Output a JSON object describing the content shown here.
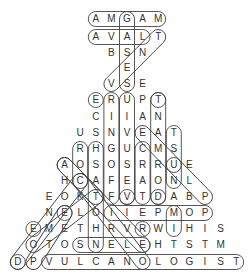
{
  "puzzle": {
    "type": "word-search",
    "shape": "volcano",
    "center_x": 127,
    "spacing": 15.6,
    "rows": [
      {
        "y": 19,
        "start": -2,
        "letters": "AMGAM"
      },
      {
        "y": 37,
        "start": -2,
        "letters": "AVALT"
      },
      {
        "y": 53,
        "start": -1,
        "letters": "BSN"
      },
      {
        "y": 68,
        "start": 0,
        "letters": "E"
      },
      {
        "y": 84,
        "start": -1,
        "letters": "VSE"
      },
      {
        "y": 100,
        "start": -2,
        "letters": "ERUPT"
      },
      {
        "y": 117,
        "start": -2,
        "letters": "CIIAN"
      },
      {
        "y": 133,
        "start": -3,
        "letters": "USNVEAT"
      },
      {
        "y": 149,
        "start": -3,
        "letters": "RHGUCMS"
      },
      {
        "y": 165,
        "start": -4,
        "letters": "AOSOSRRUE"
      },
      {
        "y": 181,
        "start": -4,
        "letters": "HCAFEAONL"
      },
      {
        "y": 197,
        "start": -5,
        "letters": "EOKTFVTDABP"
      },
      {
        "y": 213,
        "start": -5,
        "letters": "NELOIIEPMOP"
      },
      {
        "y": 229,
        "start": -6,
        "letters": "EMETHRVRWIHIS"
      },
      {
        "y": 245,
        "start": -6,
        "letters": "OTOSNELEHTSTM"
      },
      {
        "y": 262,
        "start": -7,
        "letters": "DPVULCANOLOGIST"
      }
    ],
    "found_words": [
      {
        "word": "MAGMA",
        "from": [
          0,
          -2
        ],
        "to": [
          0,
          2
        ]
      },
      {
        "word": "LAVA",
        "from": [
          1,
          -2
        ],
        "to": [
          1,
          1
        ]
      },
      {
        "word": "GASES",
        "from": [
          0,
          0
        ],
        "to": [
          4,
          0
        ]
      },
      {
        "word": "VENT",
        "from": [
          1,
          2
        ],
        "to": [
          4,
          -1
        ]
      },
      {
        "word": "ERUPT",
        "from": [
          5,
          -2
        ],
        "to": [
          5,
          -2
        ]
      },
      {
        "word": "RING OF F",
        "from": [
          5,
          -1
        ],
        "to": [
          11,
          -1
        ]
      },
      {
        "word": "VESUVIU",
        "from": [
          5,
          0
        ],
        "to": [
          11,
          0
        ]
      },
      {
        "word": "DORMANT",
        "from": [
          5,
          2
        ],
        "to": [
          11,
          2
        ]
      },
      {
        "word": "T",
        "from": [
          5,
          2
        ],
        "to": [
          5,
          2
        ]
      },
      {
        "word": "CRAT",
        "from": [
          8,
          1
        ],
        "to": [
          11,
          1
        ]
      },
      {
        "word": "TSUN",
        "from": [
          7,
          3
        ],
        "to": [
          10,
          3
        ]
      },
      {
        "word": "EMS",
        "from": [
          7,
          1
        ],
        "to": [
          9,
          3
        ]
      },
      {
        "word": "R",
        "from": [
          8,
          -3
        ],
        "to": [
          10,
          -3
        ]
      },
      {
        "word": "HSAT",
        "from": [
          8,
          -2
        ],
        "to": [
          14,
          -2
        ]
      },
      {
        "word": "ACK",
        "from": [
          9,
          -4
        ],
        "to": [
          11,
          -2
        ]
      },
      {
        "word": "VULCANOLOGIST",
        "from": [
          15,
          -5
        ],
        "to": [
          15,
          7
        ]
      },
      {
        "word": "SNELE",
        "from": [
          14,
          -3
        ],
        "to": [
          14,
          1
        ]
      },
      {
        "word": "IIEPMOP",
        "from": [
          12,
          -1
        ],
        "to": [
          12,
          5
        ]
      },
      {
        "word": "M I",
        "from": [
          12,
          3
        ],
        "to": [
          13,
          3
        ]
      },
      {
        "word": "D",
        "from": [
          11,
          2
        ],
        "to": [
          11,
          2
        ]
      },
      {
        "word": "V",
        "from": [
          11,
          0
        ],
        "to": [
          11,
          0
        ]
      },
      {
        "word": "R",
        "from": [
          13,
          1
        ],
        "to": [
          13,
          1
        ]
      },
      {
        "word": "E",
        "from": [
          12,
          -4
        ],
        "to": [
          12,
          -4
        ]
      },
      {
        "word": "E",
        "from": [
          13,
          -6
        ],
        "to": [
          13,
          -6
        ]
      },
      {
        "word": "D",
        "from": [
          15,
          -7
        ],
        "to": [
          15,
          -7
        ]
      },
      {
        "word": "UE/P diag",
        "from": [
          9,
          3
        ],
        "to": [
          11,
          5
        ]
      },
      {
        "word": "diag1",
        "from": [
          9,
          -4
        ],
        "to": [
          14,
          1
        ]
      },
      {
        "word": "diag2",
        "from": [
          10,
          -3
        ],
        "to": [
          15,
          1
        ]
      },
      {
        "word": "diag3",
        "from": [
          10,
          -3
        ],
        "to": [
          15,
          -7
        ]
      },
      {
        "word": "diag4",
        "from": [
          11,
          -2
        ],
        "to": [
          14,
          -6
        ]
      },
      {
        "word": "diag5",
        "from": [
          12,
          -4
        ],
        "to": [
          15,
          -6
        ]
      }
    ]
  }
}
